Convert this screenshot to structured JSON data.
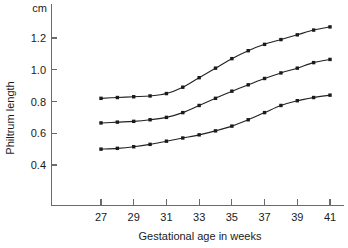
{
  "chart_data": {
    "type": "line",
    "title": "",
    "xlabel": "Gestational age in weeks",
    "ylabel": "Philtrum length",
    "yunit": "cm",
    "xlim": [
      26,
      42
    ],
    "ylim": [
      0.33,
      1.32
    ],
    "xticks": [
      27,
      29,
      31,
      33,
      35,
      37,
      39,
      41
    ],
    "yticks": [
      0.4,
      0.6,
      0.8,
      1.0,
      1.2
    ],
    "xtick_labels": [
      "27",
      "29",
      "31",
      "33",
      "35",
      "37",
      "39",
      "41"
    ],
    "ytick_labels": [
      "0.4",
      "0.6",
      "0.8",
      "1.0",
      "1.2"
    ],
    "grid": false,
    "legend": "none",
    "x": [
      27,
      28,
      29,
      30,
      31,
      32,
      33,
      34,
      35,
      36,
      37,
      38,
      39,
      40,
      41
    ],
    "series": [
      {
        "name": "upper centile",
        "values": [
          0.82,
          0.825,
          0.83,
          0.835,
          0.85,
          0.89,
          0.95,
          1.01,
          1.07,
          1.12,
          1.16,
          1.19,
          1.22,
          1.25,
          1.27
        ]
      },
      {
        "name": "median centile",
        "values": [
          0.665,
          0.67,
          0.675,
          0.685,
          0.7,
          0.73,
          0.775,
          0.82,
          0.865,
          0.905,
          0.945,
          0.98,
          1.01,
          1.045,
          1.065
        ]
      },
      {
        "name": "lower centile",
        "values": [
          0.5,
          0.505,
          0.515,
          0.53,
          0.55,
          0.57,
          0.59,
          0.615,
          0.645,
          0.685,
          0.73,
          0.775,
          0.805,
          0.825,
          0.84
        ]
      }
    ]
  }
}
